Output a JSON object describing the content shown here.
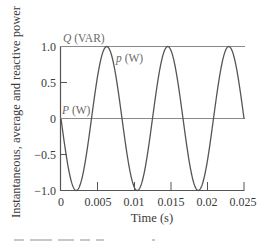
{
  "chart_data": {
    "type": "line",
    "title": "",
    "xlabel": "Time (s)",
    "ylabel": "Instantaneous, average and reactive power",
    "xlim": [
      0,
      0.025
    ],
    "ylim": [
      -1.0,
      1.0
    ],
    "grid": false,
    "x_ticks": [
      "0",
      "0.005",
      "0.01",
      "0.015",
      "0.02",
      "0.025"
    ],
    "y_ticks": [
      "1.0",
      "0.5",
      "0",
      "−0.5",
      "−1.0"
    ],
    "series": [
      {
        "name": "p (W)",
        "description": "instantaneous power, sinusoid at 120 Hz",
        "formula": "p(t) = -sin(2*pi*120*t)",
        "x": [
          0,
          0.00208,
          0.00417,
          0.00625,
          0.00833,
          0.01042,
          0.0125,
          0.01458,
          0.01667,
          0.01875,
          0.02083,
          0.02292,
          0.025
        ],
        "values": [
          0,
          -1.0,
          0,
          1.0,
          0,
          -1.0,
          0,
          1.0,
          0,
          -1.0,
          0,
          1.0,
          0
        ]
      },
      {
        "name": "Q (VAR)",
        "description": "reactive power, constant",
        "x": [
          0,
          0.025
        ],
        "values": [
          1.0,
          1.0
        ]
      },
      {
        "name": "P (W)",
        "description": "average power, constant",
        "x": [
          0,
          0.025
        ],
        "values": [
          0,
          0
        ]
      }
    ],
    "annotations": [
      {
        "text": "Q (VAR)",
        "x": 0.0003,
        "y": 1.05
      },
      {
        "text": "p (W)",
        "x": 0.0075,
        "y": 0.8
      },
      {
        "text": "P (W)",
        "x": 0.0001,
        "y": 0.05
      }
    ]
  },
  "labels": {
    "xlabel": "Time (s)",
    "ylabel": "Instantaneous, average and reactive power",
    "q_var": {
      "sym": "Q",
      "unit": " (VAR)"
    },
    "p_inst": {
      "sym": "p",
      "unit": " (W)"
    },
    "p_avg": {
      "sym": "P",
      "unit": " (W)"
    },
    "x_ticks": [
      "0",
      "0.005",
      "0.01",
      "0.015",
      "0.02",
      "0.025"
    ],
    "y_ticks": [
      "1.0",
      "0.5",
      "0",
      "−0.5",
      "−1.0"
    ]
  },
  "colors": {
    "curve": "#555555",
    "axis": "#555555",
    "reference_line": "#8a8a8a",
    "text": "#3a3a3a"
  }
}
